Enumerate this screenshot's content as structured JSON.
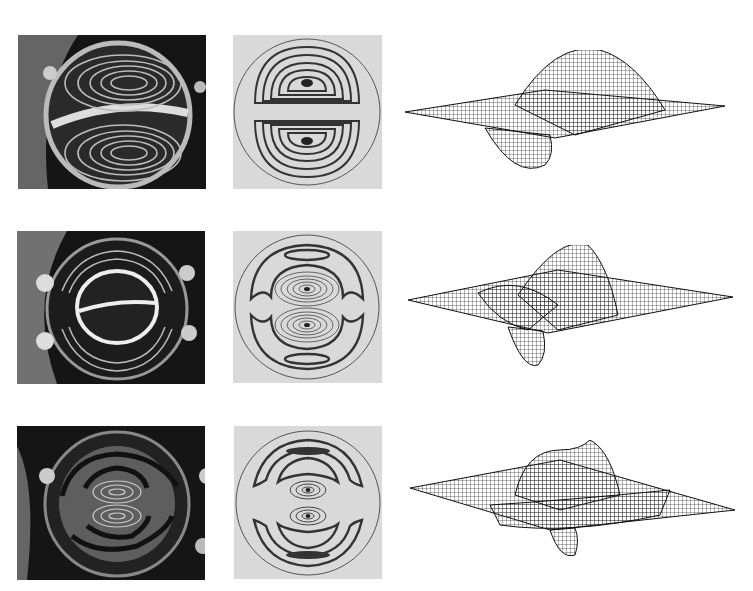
{
  "figure": {
    "layout": "3 rows x 3 columns",
    "columns": [
      "experimental-interferogram-photo",
      "computed-fringe-pattern",
      "3d-mode-shape-mesh"
    ],
    "rows": [
      {
        "mode": 1,
        "description": "two-lobe mode, horizontal nodal line",
        "photo": {
          "x": 18,
          "y": 35,
          "w": 188,
          "h": 154
        },
        "fringe": {
          "x": 233,
          "y": 35,
          "w": 149,
          "h": 154
        },
        "mesh": {
          "x": 405,
          "y": 50,
          "w": 330,
          "h": 125
        }
      },
      {
        "mode": 2,
        "description": "two-lobe center with outer crescent rings",
        "photo": {
          "x": 17,
          "y": 231,
          "w": 188,
          "h": 153
        },
        "fringe": {
          "x": 233,
          "y": 231,
          "w": 149,
          "h": 152
        },
        "mesh": {
          "x": 408,
          "y": 245,
          "w": 330,
          "h": 125
        }
      },
      {
        "mode": 3,
        "description": "two-lobe center with two outer crescent rings",
        "photo": {
          "x": 17,
          "y": 426,
          "w": 188,
          "h": 154
        },
        "fringe": {
          "x": 234,
          "y": 426,
          "w": 148,
          "h": 153
        },
        "mesh": {
          "x": 410,
          "y": 440,
          "w": 330,
          "h": 120
        }
      }
    ],
    "colors": {
      "background": "#ffffff",
      "photo_bg": "#111111",
      "fringe_bg": "#d9d9d9",
      "fringe_line": "#333333",
      "mesh_line": "#2a2a2a"
    }
  }
}
